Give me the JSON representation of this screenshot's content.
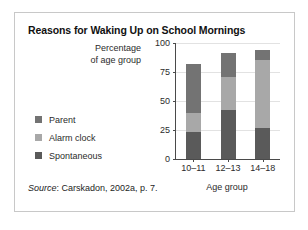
{
  "chart_data": {
    "type": "bar",
    "subtype": "stacked-bar",
    "title": "Reasons for Waking Up on School Mornings",
    "xlabel": "Age group",
    "ylabel": "Percentage\nof age group",
    "ylabel_line1": "Percentage",
    "ylabel_line2": "of age group",
    "categories": [
      "10–11",
      "12–13",
      "14–18"
    ],
    "series": [
      {
        "name": "Spontaneous",
        "values": [
          23,
          42,
          27
        ],
        "color": "#5a5a5a"
      },
      {
        "name": "Alarm clock",
        "values": [
          17,
          29,
          58
        ],
        "color": "#a8a8a8"
      },
      {
        "name": "Parent",
        "values": [
          42,
          20,
          9
        ],
        "color": "#737373"
      }
    ],
    "cumulative_tops": [
      {
        "category": "10–11",
        "spontaneous": 23,
        "alarm_clock": 40,
        "parent": 82
      },
      {
        "category": "12–13",
        "spontaneous": 42,
        "alarm_clock": 71,
        "parent": 91
      },
      {
        "category": "14–18",
        "spontaneous": 27,
        "alarm_clock": 85,
        "parent": 94
      }
    ],
    "stack_order_bottom_to_top": [
      "Spontaneous",
      "Alarm clock",
      "Parent"
    ],
    "ylim": [
      0,
      100
    ],
    "yticks": [
      0,
      25,
      50,
      75,
      100
    ],
    "ytick_labels": [
      "0",
      "25",
      "50",
      "75",
      "100"
    ],
    "grid": true,
    "legend_position": "left",
    "legend_order": [
      "Parent",
      "Alarm clock",
      "Spontaneous"
    ]
  },
  "legend": {
    "items": [
      {
        "label": "Parent",
        "color": "#737373"
      },
      {
        "label": "Alarm clock",
        "color": "#a8a8a8"
      },
      {
        "label": "Spontaneous",
        "color": "#5a5a5a"
      }
    ]
  },
  "source": {
    "prefix": "Source",
    "text": ": Carskadon, 2002a, p. 7."
  }
}
